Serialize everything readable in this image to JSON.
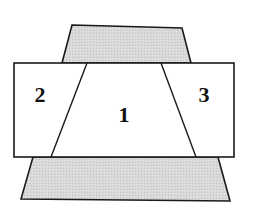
{
  "diagram": {
    "colors": {
      "shaded_fill": "#d6d6d6",
      "region_fill": "#ffffff",
      "stroke": "#1a1a1a"
    },
    "shapes": {
      "top_trapezoid": "72,25 182,28 191,63 62,63",
      "rectangle": {
        "x": 14,
        "y": 63,
        "width": 220,
        "height": 94
      },
      "bottom_trapezoid": "33,157 218,157 230,201 21,199",
      "left_divider": {
        "x1": 87,
        "y1": 63,
        "x2": 51,
        "y2": 157
      },
      "right_divider": {
        "x1": 161,
        "y1": 63,
        "x2": 196,
        "y2": 157
      }
    },
    "regions": [
      {
        "id": "1",
        "label": "1",
        "x": 124,
        "y": 122
      },
      {
        "id": "2",
        "label": "2",
        "x": 40,
        "y": 102
      },
      {
        "id": "3",
        "label": "3",
        "x": 204,
        "y": 102
      }
    ]
  }
}
